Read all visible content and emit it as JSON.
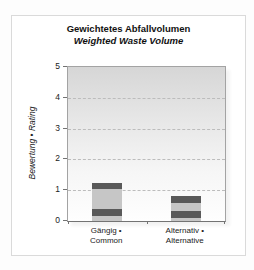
{
  "card": {
    "title": "Gewichtetes Abfallvolumen",
    "subtitle": "Weighted Waste Volume"
  },
  "chart_data": {
    "type": "bar",
    "variant": "stacked",
    "title": "Gewichtetes Abfallvolumen",
    "subtitle": "Weighted Waste Volume",
    "xlabel": "",
    "ylabel": "Bewertung • Rating",
    "ylim": [
      0,
      5
    ],
    "yticks": [
      "0",
      "1",
      "2",
      "3",
      "4",
      "5"
    ],
    "grid": {
      "horizontal_dashed_at": [
        1,
        2,
        3,
        4
      ]
    },
    "legend": "none",
    "categories": [
      {
        "label_lines": [
          "Gängig •",
          "Common"
        ],
        "total": 1.22,
        "segments": [
          {
            "value": 0.15,
            "color": "#c6c6c6"
          },
          {
            "value": 0.25,
            "color": "#595959"
          },
          {
            "value": 0.65,
            "color": "#c6c6c6"
          },
          {
            "value": 0.17,
            "color": "#595959"
          }
        ]
      },
      {
        "label_lines": [
          "Alternativ •",
          "Alternative"
        ],
        "total": 0.8,
        "segments": [
          {
            "value": 0.1,
            "color": "#c6c6c6"
          },
          {
            "value": 0.22,
            "color": "#595959"
          },
          {
            "value": 0.26,
            "color": "#c6c6c6"
          },
          {
            "value": 0.22,
            "color": "#595959"
          }
        ]
      }
    ],
    "colors": {
      "segment_light": "#c6c6c6",
      "segment_dark": "#595959",
      "plot_bg_top": "#d6d6d6",
      "plot_bg_bottom": "#fefefe",
      "gridline": "#bcbcbc",
      "plot_border": "#a3a3a3",
      "axis": "#737373"
    }
  }
}
